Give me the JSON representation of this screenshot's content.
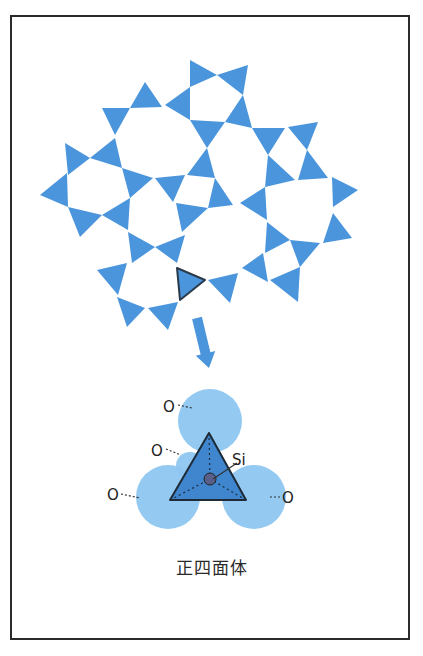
{
  "figure": {
    "caption": "正四面体",
    "colors": {
      "tetra_fill": "#4a95dc",
      "highlight_stroke": "#2a3a4a",
      "oxygen_fill": "#8ec6f0",
      "tetra_face": "#3f86cf",
      "si_atom": "#5a5f8a",
      "frame": "#2b2b2b"
    },
    "network": {
      "description": "silicate network of corner-sharing SiO4 tetrahedra (top view)",
      "highlighted_index": 29,
      "triangles": [
        [
          [
            190,
            60
          ],
          [
            217,
            75
          ],
          [
            190,
            87
          ]
        ],
        [
          [
            217,
            75
          ],
          [
            248,
            65
          ],
          [
            243,
            95
          ]
        ],
        [
          [
            165,
            105
          ],
          [
            190,
            87
          ],
          [
            190,
            120
          ]
        ],
        [
          [
            243,
            95
          ],
          [
            252,
            128
          ],
          [
            225,
            122
          ]
        ],
        [
          [
            145,
            82
          ],
          [
            162,
            107
          ],
          [
            130,
            108
          ]
        ],
        [
          [
            102,
            108
          ],
          [
            130,
            108
          ],
          [
            115,
            135
          ]
        ],
        [
          [
            190,
            120
          ],
          [
            225,
            122
          ],
          [
            207,
            148
          ]
        ],
        [
          [
            252,
            128
          ],
          [
            285,
            128
          ],
          [
            268,
            155
          ]
        ],
        [
          [
            288,
            127
          ],
          [
            318,
            122
          ],
          [
            307,
            150
          ]
        ],
        [
          [
            65,
            143
          ],
          [
            90,
            158
          ],
          [
            68,
            175
          ]
        ],
        [
          [
            90,
            158
          ],
          [
            115,
            138
          ],
          [
            122,
            168
          ]
        ],
        [
          [
            207,
            148
          ],
          [
            215,
            178
          ],
          [
            187,
            175
          ]
        ],
        [
          [
            268,
            155
          ],
          [
            295,
            180
          ],
          [
            265,
            187
          ]
        ],
        [
          [
            307,
            150
          ],
          [
            328,
            178
          ],
          [
            298,
            180
          ]
        ],
        [
          [
            40,
            195
          ],
          [
            67,
            173
          ],
          [
            68,
            207
          ]
        ],
        [
          [
            122,
            168
          ],
          [
            153,
            178
          ],
          [
            130,
            198
          ]
        ],
        [
          [
            155,
            178
          ],
          [
            185,
            175
          ],
          [
            173,
            202
          ]
        ],
        [
          [
            215,
            178
          ],
          [
            233,
            205
          ],
          [
            208,
            208
          ]
        ],
        [
          [
            176,
            203
          ],
          [
            208,
            208
          ],
          [
            182,
            232
          ]
        ],
        [
          [
            332,
            177
          ],
          [
            358,
            190
          ],
          [
            333,
            207
          ]
        ],
        [
          [
            240,
            203
          ],
          [
            265,
            187
          ],
          [
            267,
            220
          ]
        ],
        [
          [
            68,
            207
          ],
          [
            102,
            215
          ],
          [
            80,
            237
          ]
        ],
        [
          [
            102,
            215
          ],
          [
            130,
            198
          ],
          [
            128,
            230
          ]
        ],
        [
          [
            333,
            213
          ],
          [
            352,
            238
          ],
          [
            323,
            243
          ]
        ],
        [
          [
            267,
            222
          ],
          [
            290,
            240
          ],
          [
            265,
            253
          ]
        ],
        [
          [
            128,
            232
          ],
          [
            155,
            247
          ],
          [
            132,
            263
          ]
        ],
        [
          [
            155,
            247
          ],
          [
            185,
            235
          ],
          [
            177,
            263
          ]
        ],
        [
          [
            290,
            240
          ],
          [
            320,
            243
          ],
          [
            300,
            267
          ]
        ],
        [
          [
            97,
            270
          ],
          [
            127,
            263
          ],
          [
            118,
            295
          ]
        ],
        [
          [
            177,
            268
          ],
          [
            205,
            280
          ],
          [
            180,
            300
          ]
        ],
        [
          [
            208,
            280
          ],
          [
            238,
            273
          ],
          [
            230,
            303
          ]
        ],
        [
          [
            242,
            268
          ],
          [
            263,
            253
          ],
          [
            268,
            282
          ]
        ],
        [
          [
            270,
            280
          ],
          [
            300,
            267
          ],
          [
            298,
            302
          ]
        ],
        [
          [
            117,
            297
          ],
          [
            145,
            308
          ],
          [
            127,
            327
          ]
        ],
        [
          [
            148,
            308
          ],
          [
            178,
            302
          ],
          [
            168,
            330
          ]
        ]
      ]
    },
    "arrow": {
      "from": [
        197,
        318
      ],
      "to": [
        209,
        368
      ]
    },
    "tetrahedron": {
      "apex": [
        209,
        433
      ],
      "base_left": [
        170,
        500
      ],
      "base_right": [
        246,
        500
      ],
      "center": [
        210,
        479
      ],
      "oxygens": [
        {
          "label": "O",
          "cx": 210,
          "cy": 421,
          "r": 32
        },
        {
          "label": "O",
          "cx": 168,
          "cy": 497,
          "r": 32
        },
        {
          "label": "O",
          "cx": 254,
          "cy": 497,
          "r": 32
        },
        {
          "label": "O",
          "cx": 190,
          "cy": 466,
          "r": 14
        }
      ],
      "labels": [
        {
          "text": "O",
          "x": 163,
          "y": 412,
          "leader": [
            [
              178,
              405
            ],
            [
              192,
              408
            ]
          ]
        },
        {
          "text": "O",
          "x": 151,
          "y": 456,
          "leader": [
            [
              166,
              449
            ],
            [
              181,
              455
            ]
          ]
        },
        {
          "text": "O",
          "x": 107,
          "y": 500,
          "leader": [
            [
              121,
              494
            ],
            [
              140,
              498
            ]
          ]
        },
        {
          "text": "O",
          "x": 282,
          "y": 503,
          "leader": [
            [
              270,
              497
            ],
            [
              281,
              497
            ]
          ]
        },
        {
          "text": "Si",
          "x": 232,
          "y": 465,
          "leader": [
            [
              213,
              479
            ],
            [
              237,
              463
            ]
          ]
        }
      ]
    }
  }
}
